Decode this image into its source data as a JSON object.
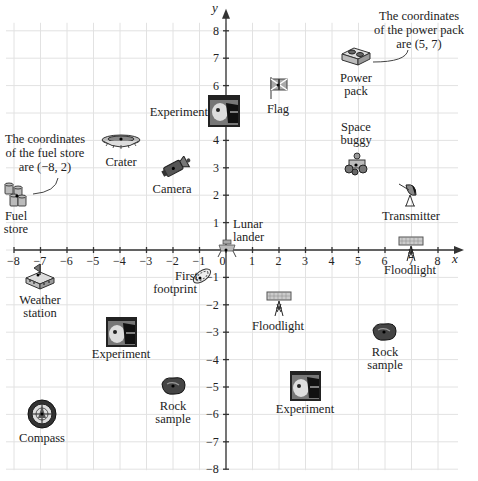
{
  "chart_data": {
    "type": "scatter",
    "title": "",
    "xlabel": "x",
    "ylabel": "y",
    "xlim": [
      -8,
      8
    ],
    "ylim": [
      -8,
      8
    ],
    "grid": true,
    "x_ticks": [
      "−8",
      "−7",
      "−6",
      "−5",
      "−4",
      "−3",
      "−2",
      "−1",
      "0",
      "1",
      "2",
      "3",
      "4",
      "5",
      "6",
      "7",
      "8"
    ],
    "y_ticks": [
      "8",
      "7",
      "6",
      "5",
      "4",
      "3",
      "2",
      "1",
      "−1",
      "−2",
      "−3",
      "−4",
      "−5",
      "−6",
      "−7",
      "−8"
    ],
    "points": [
      {
        "name": "Power pack",
        "x": 5,
        "y": 7,
        "icon": "power-pack-icon"
      },
      {
        "name": "Flag",
        "x": 2,
        "y": 6,
        "icon": "flag-icon"
      },
      {
        "name": "Experiment",
        "x": 0,
        "y": 5,
        "icon": "experiment-photo-icon"
      },
      {
        "name": "Crater",
        "x": -4,
        "y": 4,
        "icon": "crater-icon"
      },
      {
        "name": "Camera",
        "x": -2,
        "y": 3,
        "icon": "camera-icon"
      },
      {
        "name": "Fuel store",
        "x": -8,
        "y": 2,
        "icon": "fuel-barrels-icon"
      },
      {
        "name": "Space buggy",
        "x": 5,
        "y": 3,
        "icon": "space-buggy-icon"
      },
      {
        "name": "Transmitter",
        "x": 7,
        "y": 2,
        "icon": "satellite-dish-icon"
      },
      {
        "name": "Lunar lander",
        "x": 0,
        "y": 0,
        "icon": "lunar-lander-icon"
      },
      {
        "name": "Floodlight",
        "x": 7,
        "y": 0,
        "icon": "floodlight-icon"
      },
      {
        "name": "First footprint",
        "x": -1,
        "y": -1,
        "icon": "footprint-icon"
      },
      {
        "name": "Weather station",
        "x": -7,
        "y": -1,
        "icon": "weather-station-icon"
      },
      {
        "name": "Floodlight",
        "x": 2,
        "y": -2,
        "icon": "floodlight-icon"
      },
      {
        "name": "Experiment",
        "x": -4,
        "y": -3,
        "icon": "experiment-photo-icon"
      },
      {
        "name": "Rock sample",
        "x": 6,
        "y": -3,
        "icon": "rock-sample-icon"
      },
      {
        "name": "Rock sample",
        "x": -2,
        "y": -5,
        "icon": "rock-sample-icon"
      },
      {
        "name": "Experiment",
        "x": 3,
        "y": -5,
        "icon": "experiment-photo-icon"
      },
      {
        "name": "Compass",
        "x": -7,
        "y": -6,
        "icon": "compass-icon"
      }
    ],
    "annotations": [
      {
        "text": "The coordinates of the fuel store are (−8, 2)",
        "target": "Fuel store"
      },
      {
        "text": "The coordinates of the power pack are (5, 7)",
        "target": "Power pack"
      }
    ]
  },
  "axes": {
    "x_label": "x",
    "y_label": "y"
  },
  "labels": {
    "power_pack_1": "Power",
    "power_pack_2": "pack",
    "flag": "Flag",
    "experiment_a": "Experiment",
    "crater": "Crater",
    "camera": "Camera",
    "fuel_store_1": "Fuel",
    "fuel_store_2": "store",
    "space_buggy_1": "Space",
    "space_buggy_2": "buggy",
    "transmitter": "Transmitter",
    "lunar_lander_1": "Lunar",
    "lunar_lander_2": "lander",
    "floodlight_a": "Floodlight",
    "first_footprint_1": "First",
    "first_footprint_2": "footprint",
    "weather_station_1": "Weather",
    "weather_station_2": "station",
    "floodlight_b": "Floodlight",
    "experiment_b": "Experiment",
    "rock_sample_a_1": "Rock",
    "rock_sample_a_2": "sample",
    "rock_sample_b_1": "Rock",
    "rock_sample_b_2": "sample",
    "experiment_c": "Experiment",
    "compass": "Compass"
  },
  "notes": {
    "fuel_1": "The coordinates",
    "fuel_2": "of the fuel store",
    "fuel_3": "are (−8, 2)",
    "power_1": "The coordinates",
    "power_2": "of the power pack",
    "power_3": "are (5, 7)"
  },
  "colors": {
    "grid": "#e2e2e2",
    "axis": "#333333",
    "text": "#222222"
  }
}
